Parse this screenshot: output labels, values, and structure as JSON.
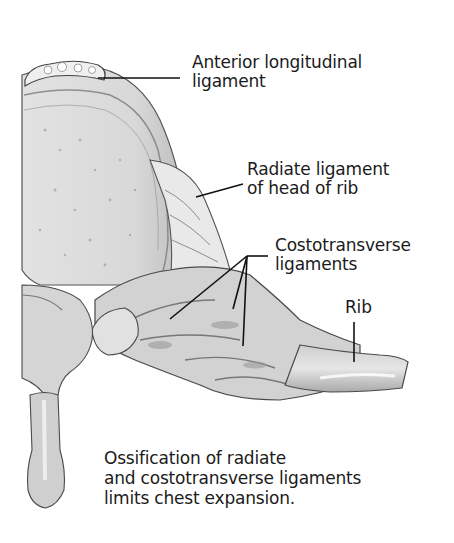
{
  "figure": {
    "background_color": "#ffffff",
    "ink_color": "#1b1b1b",
    "bone_color": "#d9d9d9"
  },
  "labels": {
    "anterior_longitudinal": {
      "line1": "Anterior longitudinal",
      "line2": "ligament"
    },
    "radiate": {
      "line1": "Radiate ligament",
      "line2": "of head of rib"
    },
    "costotransverse": {
      "line1": "Costotransverse",
      "line2": "ligaments"
    },
    "rib": {
      "line1": "Rib"
    }
  },
  "caption": {
    "line1": "Ossification of radiate",
    "line2": "and costotransverse ligaments",
    "line3": "limits chest expansion."
  }
}
